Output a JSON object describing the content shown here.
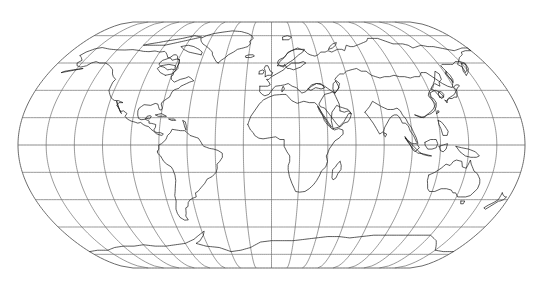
{
  "figure": {
    "kind": "world-map",
    "projection_name": "Eckert V",
    "background_color": "#ffffff",
    "width": 543,
    "height": 292
  },
  "style": {
    "graticule_color": "#6e6e6e",
    "coastline_color": "#1a1a1a",
    "border_color": "#5a5a5a",
    "graticule_width": 0.7,
    "coastline_width": 0.72
  },
  "chart_data": {
    "type": "map",
    "title": "",
    "subtitle": "",
    "xlabel": "",
    "ylabel": "",
    "projection": "Eckert V pseudocylindrical",
    "central_meridian": 0,
    "grid": true,
    "legend": "none",
    "graticule": {
      "meridian_interval_deg": 20,
      "parallel_interval_deg": 20,
      "meridians_deg": [
        -180,
        -160,
        -140,
        -120,
        -100,
        -80,
        -60,
        -40,
        -20,
        0,
        20,
        40,
        60,
        80,
        100,
        120,
        140,
        160,
        180
      ],
      "parallels_deg": [
        -90,
        -70,
        -50,
        -30,
        -10,
        10,
        30,
        50,
        70,
        90
      ],
      "parallels_drawn_deg": [
        -80,
        -60,
        -40,
        -20,
        0,
        20,
        40,
        60,
        80
      ],
      "equator_deg": 0,
      "pole_line_top_deg": 90,
      "pole_line_bottom_deg": -90
    },
    "extent": {
      "lon_min": -180,
      "lon_max": 180,
      "lat_min": -90,
      "lat_max": 90
    },
    "pixel_geometry": {
      "equator_y": 145,
      "equator_x_left": 18,
      "equator_x_right": 525,
      "pole_line_top_y": 22,
      "pole_line_bottom_y": 269,
      "pole_line_x_left": 133,
      "pole_line_x_right": 410,
      "parallel_spacing_px": 21,
      "meridian_count": 19,
      "parallel_count": 9
    },
    "features": [
      "North America",
      "South America",
      "Europe",
      "Africa",
      "Asia",
      "Australia",
      "Antarctica",
      "Greenland",
      "Canadian Arctic Archipelago",
      "British Isles",
      "Japan",
      "Madagascar",
      "New Zealand",
      "Indonesia",
      "Philippines",
      "Iceland"
    ],
    "values": [],
    "categories": []
  }
}
